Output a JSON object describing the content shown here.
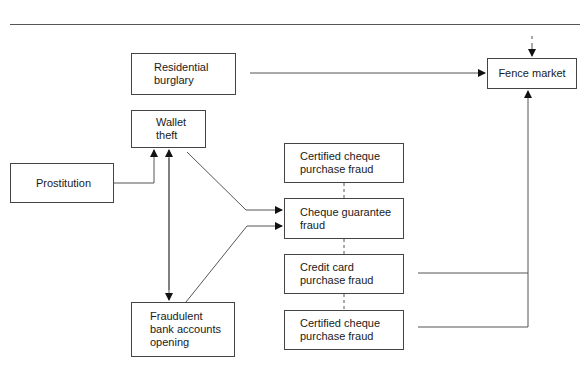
{
  "diagram": {
    "title": "",
    "nodes": {
      "residential_burglary": "Residential\nburglary",
      "wallet_theft": "Wallet\ntheft",
      "prostitution": "Prostitution",
      "fraudulent_bank": "Fraudulent\nbank accounts\nopening",
      "certified_cheque_1": "Certified cheque\npurchase fraud",
      "cheque_guarantee": "Cheque guarantee\nfraud",
      "credit_card": "Credit card\npurchase fraud",
      "certified_cheque_2": "Certified cheque\npurchase fraud",
      "fence_market": "Fence market"
    },
    "edges": [
      {
        "from": "Residential burglary",
        "to": "Fence market"
      },
      {
        "from": "Prostitution",
        "to": "Wallet theft"
      },
      {
        "from": "Wallet theft",
        "to": "Fraudulent bank accounts opening",
        "bidirectional": true
      },
      {
        "from": "Wallet theft",
        "to": "Cheque guarantee fraud"
      },
      {
        "from": "Fraudulent bank accounts opening",
        "to": "Cheque guarantee fraud"
      },
      {
        "from": "Credit card purchase fraud",
        "to": "Fence market"
      },
      {
        "from": "Certified cheque purchase fraud",
        "to": "Fence market"
      },
      {
        "from": "(above)",
        "to": "Fence market"
      }
    ]
  }
}
